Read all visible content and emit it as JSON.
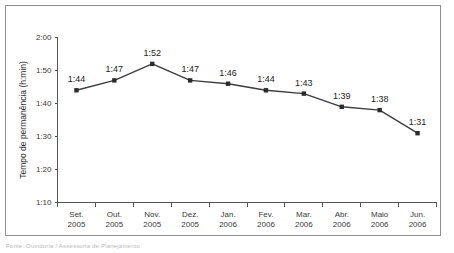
{
  "chart_data": {
    "type": "line",
    "title": "",
    "xlabel": "",
    "ylabel": "Tempo de permanência (h:min)",
    "categories": [
      "Set.\n2005",
      "Out.\n2005",
      "Nov.\n2005",
      "Dez.\n2005",
      "Jan.\n2006",
      "Fev.\n2006",
      "Mar.\n2006",
      "Abr.\n2006",
      "Maio\n2006",
      "Jun.\n2006"
    ],
    "category_month": [
      "Set.",
      "Out.",
      "Nov.",
      "Dez.",
      "Jan.",
      "Fev.",
      "Mar.",
      "Abr.",
      "Maio",
      "Jun."
    ],
    "category_year": [
      "2005",
      "2005",
      "2005",
      "2005",
      "2006",
      "2006",
      "2006",
      "2006",
      "2006",
      "2006"
    ],
    "values": [
      104,
      107,
      112,
      107,
      106,
      104,
      103,
      99,
      98,
      91
    ],
    "value_labels": [
      "1:44",
      "1:47",
      "1:52",
      "1:47",
      "1:46",
      "1:44",
      "1:43",
      "1:39",
      "1:38",
      "1:31"
    ],
    "ylim": [
      70,
      120
    ],
    "ytick_values": [
      70,
      80,
      90,
      100,
      110,
      120
    ],
    "ytick_labels": [
      "1:10",
      "1:20",
      "1:30",
      "1:40",
      "1:50",
      "2:00"
    ],
    "grid": false,
    "legend": null,
    "series_color": "#3d3d3d",
    "marker_color": "#2b2b2b",
    "axis_color": "#555555",
    "frame_color": "#8e8e8e"
  },
  "caption": {
    "text": "Fonte: Ouvidoria / Assessoria de Planejamento"
  }
}
